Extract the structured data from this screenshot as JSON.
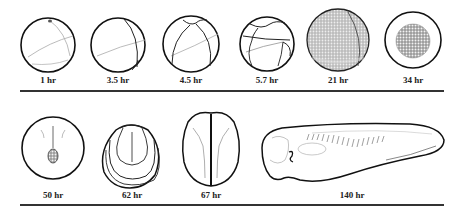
{
  "figure": {
    "row1": {
      "stages": [
        {
          "label": "1 hr"
        },
        {
          "label": "3.5 hr"
        },
        {
          "label": "4.5 hr"
        },
        {
          "label": "5.7 hr"
        },
        {
          "label": "21 hr"
        },
        {
          "label": "34 hr"
        }
      ]
    },
    "row2": {
      "stages": [
        {
          "label": "50 hr"
        },
        {
          "label": "62 hr"
        },
        {
          "label": "67 hr"
        },
        {
          "label": "140 hr"
        }
      ]
    }
  }
}
